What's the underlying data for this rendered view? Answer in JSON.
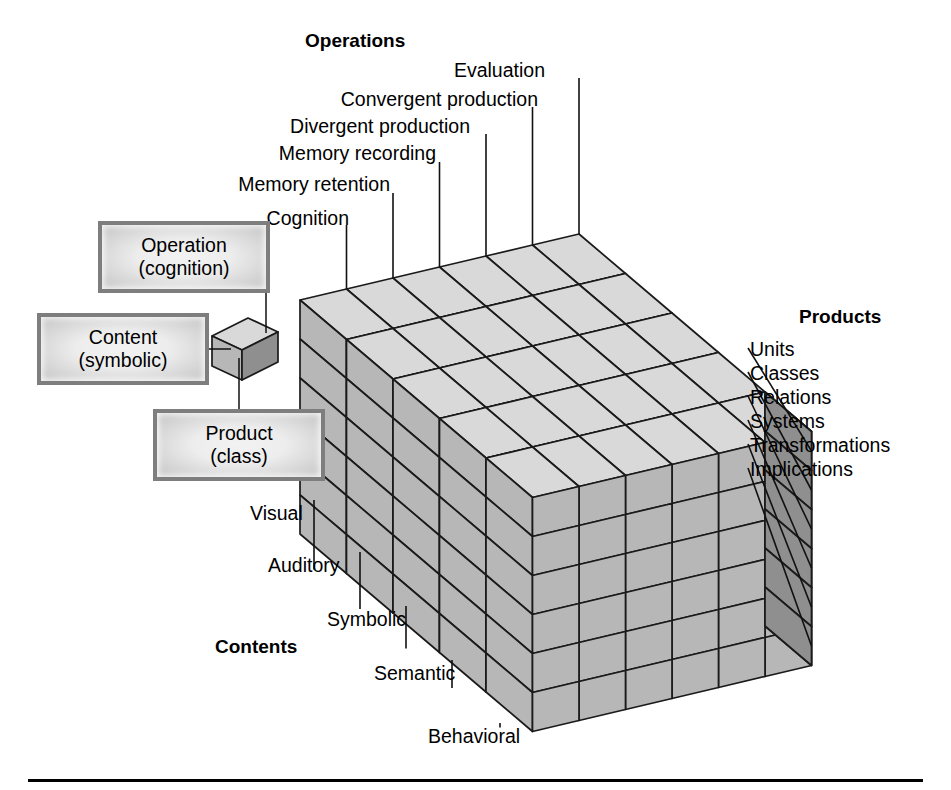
{
  "figure": {
    "background_color": "#ffffff",
    "rule_color": "#000000"
  },
  "axes": {
    "operations": {
      "title": "Operations",
      "labels": [
        "Cognition",
        "Memory retention",
        "Memory recording",
        "Divergent production",
        "Convergent production",
        "Evaluation"
      ]
    },
    "contents": {
      "title": "Contents",
      "labels": [
        "Visual",
        "Auditory",
        "Symbolic",
        "Semantic",
        "Behavioral"
      ]
    },
    "products": {
      "title": "Products",
      "labels": [
        "Units",
        "Classes",
        "Relations",
        "Systems",
        "Transformations",
        "Implications"
      ]
    }
  },
  "legend": {
    "boxes": [
      {
        "line1": "Operation",
        "line2": "(cognition)"
      },
      {
        "line1": "Content",
        "line2": "(symbolic)"
      },
      {
        "line1": "Product",
        "line2": "(class)"
      }
    ]
  },
  "chart_data": {
    "type": "diagram-3d-grid",
    "dimensions": {
      "operations": 6,
      "contents": 5,
      "products": 6
    },
    "total_cells": 180,
    "operations": [
      "Cognition",
      "Memory retention",
      "Memory recording",
      "Divergent production",
      "Convergent production",
      "Evaluation"
    ],
    "contents": [
      "Visual",
      "Auditory",
      "Symbolic",
      "Semantic",
      "Behavioral"
    ],
    "products": [
      "Units",
      "Classes",
      "Relations",
      "Systems",
      "Transformations",
      "Implications"
    ],
    "highlighted_cell": {
      "operation": "cognition",
      "content": "symbolic",
      "product": "class"
    },
    "colors": {
      "top_face": "#d9d9d9",
      "front_face": "#b7b7b7",
      "side_face": "#8f8f8f",
      "outline": "#1a1a1a"
    }
  }
}
